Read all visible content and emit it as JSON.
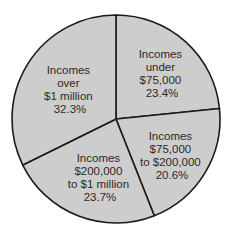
{
  "chart_data": {
    "type": "pie",
    "title": "",
    "categories": [
      "Incomes under $75,000",
      "Incomes $75,000 to $200,000",
      "Incomes $200,000 to $1 million",
      "Incomes over $1 million"
    ],
    "values": [
      23.4,
      20.6,
      23.7,
      32.3
    ],
    "unit": "%",
    "slices": [
      {
        "label_lines": [
          "Incomes",
          "under",
          "$75,000",
          "23.4%"
        ],
        "value": 23.4
      },
      {
        "label_lines": [
          "Incomes",
          "$75,000",
          "to $200,000",
          "20.6%"
        ],
        "value": 20.6
      },
      {
        "label_lines": [
          "Incomes",
          "$200,000",
          "to $1 million",
          "23.7%"
        ],
        "value": 23.7
      },
      {
        "label_lines": [
          "Incomes",
          "over",
          "$1 million",
          "32.3%"
        ],
        "value": 32.3
      }
    ],
    "legend": "none",
    "grid": false,
    "colors": {
      "fill": "#cdcdcd",
      "stroke": "#1a1a1a",
      "text": "#2a2a2a"
    }
  }
}
